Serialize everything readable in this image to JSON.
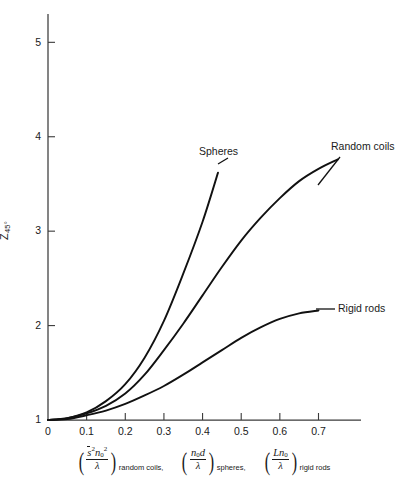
{
  "figure": {
    "background": "#ffffff",
    "ink": "#111111"
  },
  "chart_data": {
    "type": "line",
    "title": "",
    "subtitle": "",
    "ylabel": "Z",
    "ylabel_sub": "45°",
    "ylabel_full": "Z45°",
    "xlabel_terms": [
      {
        "numerator": "s̄²n₀²",
        "numerator_parts": {
          "s_bar": "s",
          "s_exp": "2",
          "n": "n",
          "n_sub": "0",
          "n_exp": "2"
        },
        "denominator": "λ",
        "subscript": "random coils,"
      },
      {
        "numerator": "n₀d",
        "numerator_parts": {
          "n": "n",
          "n_sub": "0",
          "d": "d"
        },
        "denominator": "λ",
        "subscript": "spheres,"
      },
      {
        "numerator": "Ln₀",
        "numerator_parts": {
          "L": "L",
          "n": "n",
          "n_sub": "0"
        },
        "denominator": "λ",
        "subscript": "rigid rods"
      }
    ],
    "xlim": [
      0,
      0.81
    ],
    "ylim": [
      1,
      5.3
    ],
    "xticks": [
      0,
      0.1,
      0.2,
      0.3,
      0.4,
      0.5,
      0.6,
      0.7
    ],
    "xticklabels": [
      "0",
      "0.1",
      "0.2",
      "0.3",
      "0.4",
      "0.5",
      "0.6",
      "0.7"
    ],
    "yticks": [
      1,
      2,
      3,
      4,
      5
    ],
    "yticklabels": [
      "1",
      "2",
      "3",
      "4",
      "5"
    ],
    "grid": false,
    "legend": "inline-annotations",
    "series": [
      {
        "name": "Spheres",
        "label": "Spheres",
        "points": [
          {
            "x": 0.0,
            "y": 1.0
          },
          {
            "x": 0.05,
            "y": 1.02
          },
          {
            "x": 0.1,
            "y": 1.08
          },
          {
            "x": 0.15,
            "y": 1.2
          },
          {
            "x": 0.2,
            "y": 1.38
          },
          {
            "x": 0.25,
            "y": 1.66
          },
          {
            "x": 0.3,
            "y": 2.05
          },
          {
            "x": 0.35,
            "y": 2.55
          },
          {
            "x": 0.4,
            "y": 3.1
          },
          {
            "x": 0.44,
            "y": 3.62
          }
        ]
      },
      {
        "name": "Random coils",
        "label": "Random coils",
        "points": [
          {
            "x": 0.0,
            "y": 1.0
          },
          {
            "x": 0.05,
            "y": 1.02
          },
          {
            "x": 0.1,
            "y": 1.07
          },
          {
            "x": 0.15,
            "y": 1.15
          },
          {
            "x": 0.2,
            "y": 1.28
          },
          {
            "x": 0.25,
            "y": 1.48
          },
          {
            "x": 0.3,
            "y": 1.74
          },
          {
            "x": 0.35,
            "y": 2.02
          },
          {
            "x": 0.4,
            "y": 2.32
          },
          {
            "x": 0.45,
            "y": 2.62
          },
          {
            "x": 0.5,
            "y": 2.9
          },
          {
            "x": 0.55,
            "y": 3.14
          },
          {
            "x": 0.6,
            "y": 3.35
          },
          {
            "x": 0.65,
            "y": 3.53
          },
          {
            "x": 0.7,
            "y": 3.66
          },
          {
            "x": 0.75,
            "y": 3.76
          }
        ]
      },
      {
        "name": "Rigid rods",
        "label": "Rigid rods",
        "points": [
          {
            "x": 0.0,
            "y": 1.0
          },
          {
            "x": 0.05,
            "y": 1.01
          },
          {
            "x": 0.1,
            "y": 1.05
          },
          {
            "x": 0.15,
            "y": 1.1
          },
          {
            "x": 0.2,
            "y": 1.17
          },
          {
            "x": 0.25,
            "y": 1.26
          },
          {
            "x": 0.3,
            "y": 1.36
          },
          {
            "x": 0.35,
            "y": 1.48
          },
          {
            "x": 0.4,
            "y": 1.61
          },
          {
            "x": 0.45,
            "y": 1.74
          },
          {
            "x": 0.5,
            "y": 1.87
          },
          {
            "x": 0.55,
            "y": 1.98
          },
          {
            "x": 0.6,
            "y": 2.07
          },
          {
            "x": 0.65,
            "y": 2.13
          },
          {
            "x": 0.7,
            "y": 2.16
          }
        ]
      }
    ],
    "annotations": [
      {
        "name": "Spheres",
        "text": "Spheres",
        "leader": true
      },
      {
        "name": "Random coils",
        "text": "Random coils",
        "leader": true
      },
      {
        "name": "Rigid rods",
        "text": "Rigid rods",
        "leader": true
      }
    ]
  }
}
